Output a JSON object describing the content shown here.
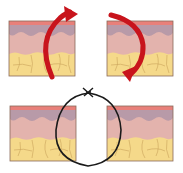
{
  "diagram": {
    "panels": [
      {
        "id": "top-left",
        "label": "",
        "arrow": "clockwise-up"
      },
      {
        "id": "top-right",
        "label": "",
        "arrow": "clockwise-down"
      },
      {
        "id": "bottom",
        "label": "",
        "suture": "loop-knot"
      }
    ],
    "colors": {
      "background": "#ffffff",
      "epidermis": "#e8807a",
      "papillary": "#b89aa8",
      "dermis": "#e3b3ad",
      "fat": "#f5d98a",
      "fat_lines": "#c9a25a",
      "border": "#8a6a5a",
      "arrow": "#c8141c",
      "suture": "#1a1a1a"
    }
  }
}
